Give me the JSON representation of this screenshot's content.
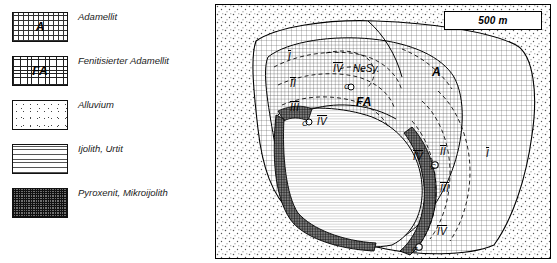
{
  "legend": {
    "items": [
      {
        "key": "adamellit",
        "swatch_label": "A",
        "swatch_style": "fill-cross",
        "text": "Adamellit"
      },
      {
        "key": "fenitisierter-adamellit",
        "swatch_label": "FA",
        "swatch_style": "fill-cross-dense",
        "text": "Fenitisierter Adamellit"
      },
      {
        "key": "alluvium",
        "swatch_label": "",
        "swatch_style": "fill-dots",
        "text": "Alluvium"
      },
      {
        "key": "ijolith-urtit",
        "swatch_label": "",
        "swatch_style": "fill-hatch",
        "text": "Ijolith, Urtit"
      },
      {
        "key": "pyroxenit-mikroijolith",
        "swatch_label": "",
        "swatch_style": "fill-dark",
        "text": "Pyroxenit, Mikroijolith"
      }
    ]
  },
  "map": {
    "scale_label": "500 m",
    "labels": [
      {
        "key": "unit-I-top",
        "text": "I",
        "x": 72,
        "y": 46,
        "cls": "rom"
      },
      {
        "key": "unit-IV-top",
        "text": "IV",
        "x": 117,
        "y": 58,
        "cls": "rom"
      },
      {
        "key": "nesy",
        "text": "NeSy.",
        "x": 137,
        "y": 58,
        "cls": ""
      },
      {
        "key": "unit-A",
        "text": "A",
        "x": 216,
        "y": 60,
        "cls": "big"
      },
      {
        "key": "unit-II-left",
        "text": "II",
        "x": 74,
        "y": 73,
        "cls": "rom"
      },
      {
        "key": "c-center-top",
        "text": "C",
        "x": 128,
        "y": 77,
        "cls": "sm"
      },
      {
        "key": "unit-FA",
        "text": "FA",
        "x": 140,
        "y": 90,
        "cls": "big"
      },
      {
        "key": "unit-III-left",
        "text": "III",
        "x": 74,
        "y": 97,
        "cls": "rom"
      },
      {
        "key": "c-left",
        "text": "C",
        "x": 86,
        "y": 114,
        "cls": "sm"
      },
      {
        "key": "unit-IV-left",
        "text": "IV",
        "x": 101,
        "y": 111,
        "cls": "rom"
      },
      {
        "key": "unit-II-right",
        "text": "II",
        "x": 224,
        "y": 141,
        "cls": "rom"
      },
      {
        "key": "unit-I-right",
        "text": "I",
        "x": 270,
        "y": 143,
        "cls": "rom"
      },
      {
        "key": "unit-IV-mid",
        "text": "IV",
        "x": 197,
        "y": 146,
        "cls": "rom"
      },
      {
        "key": "c-mid-right",
        "text": "C",
        "x": 214,
        "y": 157,
        "cls": "sm"
      },
      {
        "key": "unit-III-right",
        "text": "III",
        "x": 224,
        "y": 178,
        "cls": "rom"
      },
      {
        "key": "unit-IV-right",
        "text": "IV",
        "x": 221,
        "y": 221,
        "cls": "rom"
      },
      {
        "key": "c-bottom",
        "text": "C",
        "x": 196,
        "y": 240,
        "cls": "sm"
      }
    ]
  }
}
